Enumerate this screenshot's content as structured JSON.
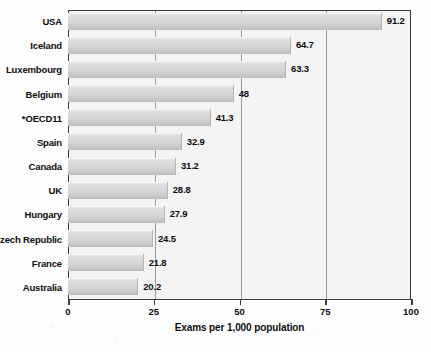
{
  "chart_data": {
    "type": "bar",
    "orientation": "horizontal",
    "title": "",
    "xlabel": "Exams per 1,000 population",
    "ylabel": "",
    "xlim": [
      0,
      100
    ],
    "xticks": [
      0,
      25,
      50,
      75,
      100
    ],
    "xtick_labels": [
      "0",
      "25",
      "50",
      "75",
      "100"
    ],
    "grid": true,
    "grid_axis": "x",
    "legend": null,
    "categories": [
      "USA",
      "Iceland",
      "Luxembourg",
      "Belgium",
      "*OECD11",
      "Spain",
      "Canada",
      "UK",
      "Hungary",
      "Czech Republic",
      "France",
      "Australia"
    ],
    "values": [
      91.2,
      64.7,
      63.3,
      48,
      41.3,
      32.9,
      31.2,
      28.8,
      27.9,
      24.5,
      21.8,
      20.2
    ],
    "value_labels": [
      "91.2",
      "64.7",
      "63.3",
      "48",
      "41.3",
      "32.9",
      "31.2",
      "28.8",
      "27.9",
      "24.5",
      "21.8",
      "20.2"
    ],
    "bar_color": "#d6d6d6",
    "plot_background": "#f4f4f4",
    "frame_color": "#3b3b3b",
    "gridline_color": "#9a9a9a",
    "text_color": "#0d0d0d"
  }
}
